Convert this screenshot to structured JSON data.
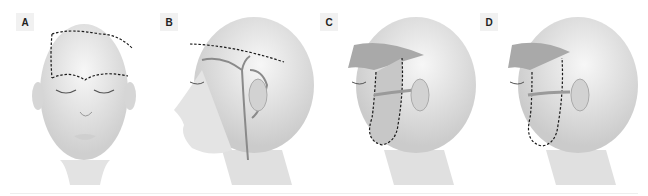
{
  "figure": {
    "panels": [
      {
        "label": "A",
        "view": "frontal",
        "description": "Frontal face with dashed outline on forehead/scalp"
      },
      {
        "label": "B",
        "view": "lateral",
        "description": "Lateral head with dashed line across scalp and branching vessels"
      },
      {
        "label": "C",
        "view": "lateral",
        "description": "Lateral head with shaded forehead flap and dashed cheek flap outline"
      },
      {
        "label": "D",
        "view": "lateral",
        "description": "Lateral head with shaded forehead flap and sutured cheek flap outline"
      }
    ],
    "colors": {
      "skin": "#e9e9e9",
      "shade": "#bdbdbd",
      "flap": "#a9a9a9",
      "vessel": "#8a8a8a",
      "dash": "#1a1a1a",
      "label_bg": "#f1f1f1"
    }
  }
}
